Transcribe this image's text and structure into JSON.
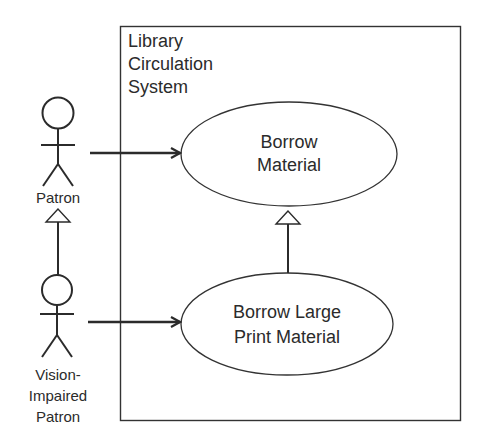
{
  "diagram": {
    "type": "UML use case diagram",
    "system": {
      "title_lines": [
        "Library",
        "Circulation",
        "System"
      ]
    },
    "actors": [
      {
        "id": "patron",
        "label_lines": [
          "Patron"
        ]
      },
      {
        "id": "vision-impaired-patron",
        "label_lines": [
          "Vision-",
          "Impaired",
          "Patron"
        ]
      }
    ],
    "use_cases": [
      {
        "id": "borrow-material",
        "label_lines": [
          "Borrow",
          "Material"
        ]
      },
      {
        "id": "borrow-large-print",
        "label_lines": [
          "Borrow Large",
          "Print Material"
        ]
      }
    ],
    "relationships": [
      {
        "type": "association",
        "from": "patron",
        "to": "borrow-material"
      },
      {
        "type": "association",
        "from": "vision-impaired-patron",
        "to": "borrow-large-print"
      },
      {
        "type": "generalization",
        "from": "vision-impaired-patron",
        "to": "patron"
      },
      {
        "type": "generalization",
        "from": "borrow-large-print",
        "to": "borrow-material"
      }
    ],
    "colors": {
      "stroke": "#2b2b2b",
      "background": "#ffffff"
    }
  }
}
